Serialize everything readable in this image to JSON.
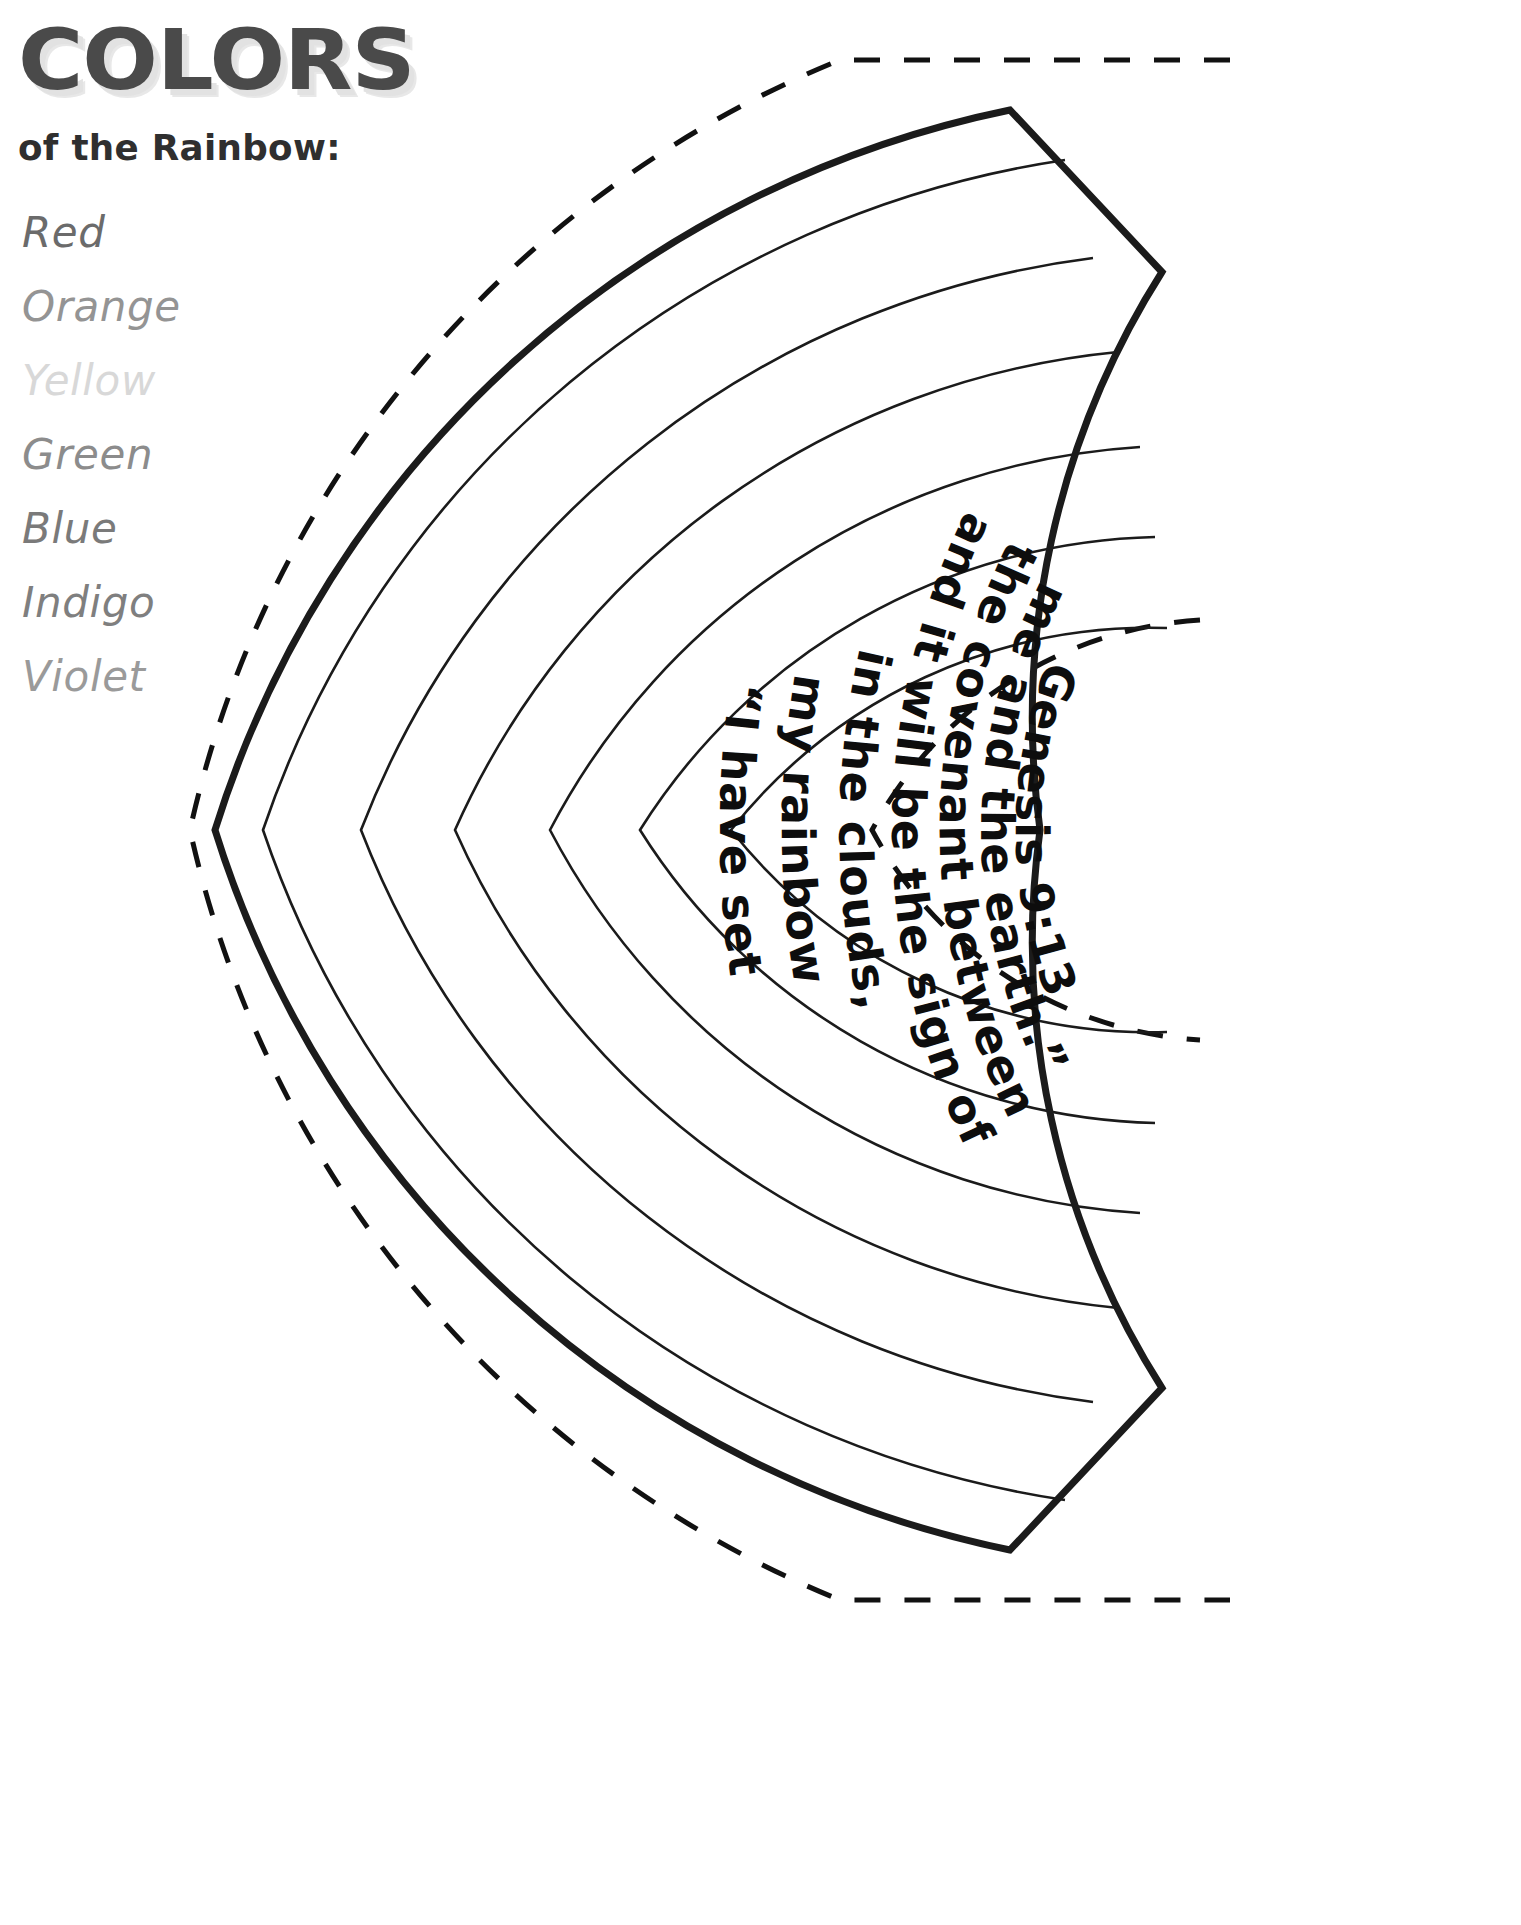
{
  "header": {
    "title": "COLORS",
    "subtitle": "of the Rainbow:"
  },
  "colors": [
    {
      "name": "Red",
      "swatch": "#6b6b6b"
    },
    {
      "name": "Orange",
      "swatch": "#949494"
    },
    {
      "name": "Yellow",
      "swatch": "#d8d8d8"
    },
    {
      "name": "Green",
      "swatch": "#8c8c8c"
    },
    {
      "name": "Blue",
      "swatch": "#7a7a7a"
    },
    {
      "name": "Indigo",
      "swatch": "#7f7f7f"
    },
    {
      "name": "Violet",
      "swatch": "#9a9a9a"
    }
  ],
  "rainbow": {
    "verse_reference": "Genesis 9:13",
    "bands": [
      {
        "index": 1,
        "text": "“I have set"
      },
      {
        "index": 2,
        "text": "my rainbow"
      },
      {
        "index": 3,
        "text": "in the clouds,"
      },
      {
        "index": 4,
        "text": "and it will be the sign of"
      },
      {
        "index": 5,
        "text": "the covenant between"
      },
      {
        "index": 6,
        "text": "me and the earth.”"
      },
      {
        "index": 7,
        "text": "Genesis 9:13"
      }
    ],
    "full_verse": "“I have set my rainbow in the clouds, and it will be the sign of the covenant between me and the earth.” Genesis 9:13",
    "line_color": "#1b1b1b",
    "cut_line_color": "#111111",
    "band_count": 7
  }
}
